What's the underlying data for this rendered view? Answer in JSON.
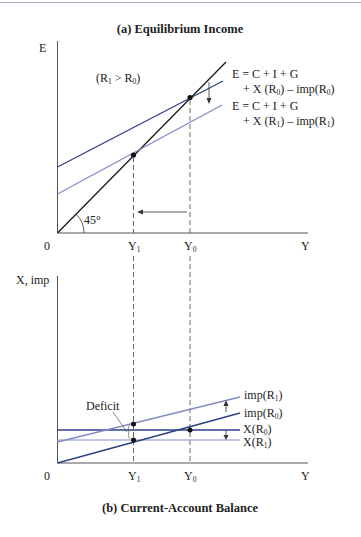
{
  "panel_a": {
    "title": "(a) Equilibrium Income",
    "y_axis_label": "E",
    "x_axis_label": "Y",
    "origin_label": "0",
    "condition_label": {
      "pre": "(R",
      "s1": "1",
      "mid": " > R",
      "s2": "0",
      "post": ")"
    },
    "angle_label": "45°",
    "x_ticks": [
      {
        "base": "Y",
        "sub": "1"
      },
      {
        "base": "Y",
        "sub": "0"
      }
    ],
    "curve_labels": [
      {
        "line1": "E = C + I + G",
        "line2_pre": "+ X (R",
        "line2_s1": "0",
        "line2_mid": ") – imp(R",
        "line2_s2": "0",
        "line2_post": ")"
      },
      {
        "line1": "E = C + I + G",
        "line2_pre": "+ X (R",
        "line2_s1": "1",
        "line2_mid": ") – imp(R",
        "line2_s2": "1",
        "line2_post": ")"
      }
    ]
  },
  "panel_b": {
    "title": "(b) Current-Account Balance",
    "y_axis_label": "X, imp",
    "x_axis_label": "Y",
    "origin_label": "0",
    "deficit_label": "Deficit",
    "x_ticks": [
      {
        "base": "Y",
        "sub": "1"
      },
      {
        "base": "Y",
        "sub": "0"
      }
    ],
    "line_labels": [
      {
        "pre": "imp(R",
        "sub": "1",
        "post": ")"
      },
      {
        "pre": "imp(R",
        "sub": "0",
        "post": ")"
      },
      {
        "pre": "X(R",
        "sub": "0",
        "post": ")"
      },
      {
        "pre": "X(R",
        "sub": "1",
        "post": ")"
      }
    ]
  },
  "colors": {
    "axis": "#555555",
    "line_45": "#1a1a1a",
    "dark_blue": "#2b3f86",
    "light_blue": "#7f8dc4",
    "pale_blue": "#a9b6dc",
    "dashed": "#555555"
  }
}
